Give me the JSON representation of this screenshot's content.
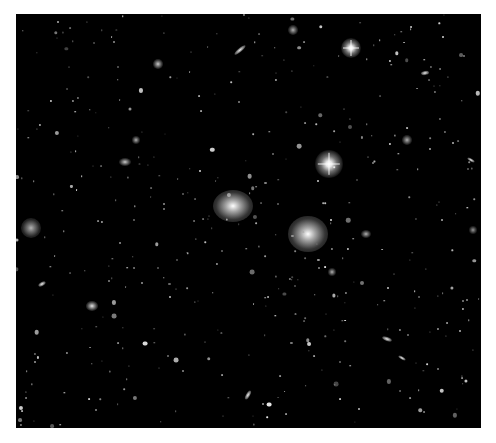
{
  "image": {
    "subject": "galaxy cluster deep field",
    "background": "#000000",
    "border": "#ffffff",
    "objects": [
      {
        "kind": "star",
        "x": 351,
        "y": 48,
        "r": 10,
        "spikes": true
      },
      {
        "kind": "star",
        "x": 329,
        "y": 164,
        "r": 14,
        "spikes": true
      },
      {
        "kind": "elliptical",
        "x": 233,
        "y": 206,
        "rx": 20,
        "ry": 16,
        "bright": 1.0
      },
      {
        "kind": "elliptical",
        "x": 308,
        "y": 234,
        "rx": 20,
        "ry": 18,
        "bright": 1.0
      },
      {
        "kind": "elliptical",
        "x": 31,
        "y": 228,
        "rx": 10,
        "ry": 10,
        "bright": 0.7
      },
      {
        "kind": "elliptical",
        "x": 293,
        "y": 30,
        "rx": 5,
        "ry": 5,
        "bright": 0.7
      },
      {
        "kind": "elliptical",
        "x": 158,
        "y": 64,
        "rx": 5,
        "ry": 5,
        "bright": 0.8
      },
      {
        "kind": "elliptical",
        "x": 125,
        "y": 162,
        "rx": 6,
        "ry": 4,
        "bright": 0.8
      },
      {
        "kind": "elliptical",
        "x": 92,
        "y": 306,
        "rx": 6,
        "ry": 5,
        "bright": 0.9
      },
      {
        "kind": "elliptical",
        "x": 407,
        "y": 140,
        "rx": 5,
        "ry": 5,
        "bright": 0.7
      },
      {
        "kind": "elliptical",
        "x": 473,
        "y": 230,
        "rx": 4,
        "ry": 4,
        "bright": 0.6
      },
      {
        "kind": "elliptical",
        "x": 366,
        "y": 234,
        "rx": 5,
        "ry": 4,
        "bright": 0.7
      },
      {
        "kind": "elliptical",
        "x": 332,
        "y": 272,
        "rx": 4,
        "ry": 4,
        "bright": 0.7
      },
      {
        "kind": "elliptical",
        "x": 136,
        "y": 140,
        "rx": 4,
        "ry": 4,
        "bright": 0.7
      },
      {
        "kind": "spiral",
        "x": 240,
        "y": 50,
        "rx": 7,
        "ry": 2,
        "angle": -40
      },
      {
        "kind": "spiral",
        "x": 387,
        "y": 339,
        "rx": 5,
        "ry": 2,
        "angle": 20
      },
      {
        "kind": "spiral",
        "x": 248,
        "y": 395,
        "rx": 5,
        "ry": 2,
        "angle": -60
      },
      {
        "kind": "spiral",
        "x": 425,
        "y": 73,
        "rx": 4,
        "ry": 2,
        "angle": -10
      },
      {
        "kind": "spiral",
        "x": 471,
        "y": 160,
        "rx": 4,
        "ry": 1.5,
        "angle": 30
      },
      {
        "kind": "spiral",
        "x": 42,
        "y": 284,
        "rx": 4,
        "ry": 2,
        "angle": -30
      },
      {
        "kind": "spiral",
        "x": 402,
        "y": 358,
        "rx": 4,
        "ry": 1.5,
        "angle": 30
      }
    ]
  }
}
